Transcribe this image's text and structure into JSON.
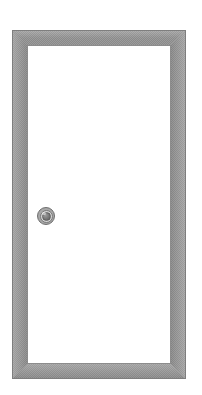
{
  "scene": {
    "title": "Door",
    "subject": "door-with-frame",
    "canvas": {
      "width": 202,
      "height": 395,
      "background_color": "#ffffff"
    }
  },
  "door": {
    "label": "Door",
    "position": {
      "x": 12,
      "y": 30
    },
    "size": {
      "width": 174,
      "height": 349
    },
    "frame": {
      "label": "Door frame",
      "thickness": 15,
      "color": "#919191",
      "outline_color": "#7e7e7e",
      "texture": "dithered-halftone",
      "corner_joint": "mitred",
      "rails": [
        {
          "name": "top-rail",
          "label": "Head jamb"
        },
        {
          "name": "right-stile",
          "label": "Right jamb"
        },
        {
          "name": "bottom-rail",
          "label": "Threshold"
        },
        {
          "name": "left-stile",
          "label": "Left jamb"
        }
      ]
    },
    "leaf": {
      "label": "Door leaf",
      "color": "#ffffff",
      "outline_color": "#8c8c8c",
      "size": {
        "width": 144,
        "height": 319
      }
    },
    "knob": {
      "label": "Door knob",
      "side": "left",
      "center": {
        "x": 46,
        "y": 216
      },
      "diameter": 18,
      "outer_ring_color": "#a8a8a8",
      "mid_ring_color": "#d7d7d7",
      "core_color": "#6e6e6e"
    }
  }
}
